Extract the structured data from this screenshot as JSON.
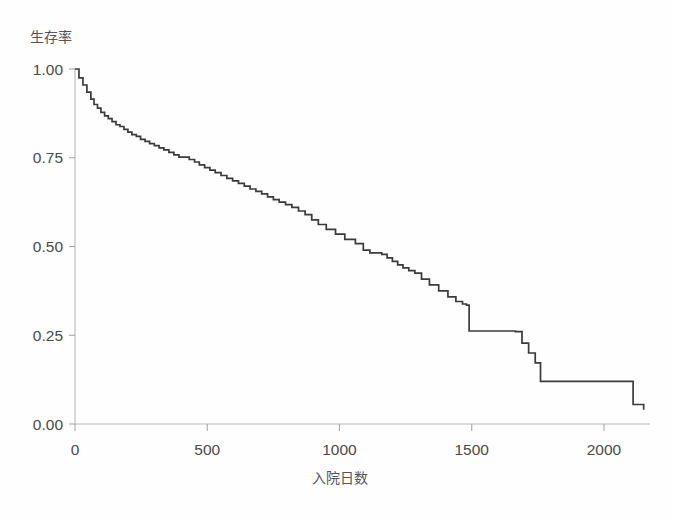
{
  "chart_data": {
    "type": "line",
    "title": "",
    "subtitle": "",
    "xlabel": "入院日数",
    "ylabel": "生存率",
    "xlim": [
      0,
      2180
    ],
    "ylim": [
      0,
      1.0
    ],
    "grid": false,
    "legend": null,
    "x_ticks": [
      {
        "value": 0,
        "label": "0"
      },
      {
        "value": 500,
        "label": "500"
      },
      {
        "value": 1000,
        "label": "1000"
      },
      {
        "value": 1500,
        "label": "1500"
      },
      {
        "value": 2000,
        "label": "2000"
      }
    ],
    "y_ticks": [
      {
        "value": 0.0,
        "label": "0.00"
      },
      {
        "value": 0.25,
        "label": "0.25"
      },
      {
        "value": 0.5,
        "label": "0.50"
      },
      {
        "value": 0.75,
        "label": "0.75"
      },
      {
        "value": 1.0,
        "label": "1.00"
      }
    ],
    "series": [
      {
        "name": "survival",
        "step": "post",
        "color": "#3b3b3b",
        "x": [
          0,
          15,
          30,
          45,
          60,
          72,
          85,
          98,
          112,
          126,
          140,
          155,
          170,
          185,
          200,
          215,
          232,
          248,
          265,
          282,
          300,
          318,
          336,
          355,
          374,
          393,
          412,
          432,
          452,
          470,
          490,
          510,
          530,
          552,
          574,
          596,
          618,
          640,
          662,
          684,
          706,
          728,
          750,
          772,
          796,
          820,
          845,
          870,
          895,
          920,
          950,
          985,
          1020,
          1060,
          1090,
          1115,
          1140,
          1160,
          1180,
          1200,
          1220,
          1240,
          1262,
          1285,
          1310,
          1340,
          1375,
          1410,
          1440,
          1465,
          1480,
          1490,
          1665,
          1690,
          1715,
          1740,
          1760,
          2085,
          2110,
          2150
        ],
        "y": [
          1.0,
          0.975,
          0.955,
          0.935,
          0.915,
          0.9,
          0.89,
          0.878,
          0.868,
          0.86,
          0.852,
          0.843,
          0.838,
          0.83,
          0.822,
          0.815,
          0.81,
          0.802,
          0.796,
          0.79,
          0.784,
          0.778,
          0.772,
          0.765,
          0.758,
          0.752,
          0.752,
          0.745,
          0.738,
          0.73,
          0.722,
          0.715,
          0.708,
          0.7,
          0.692,
          0.685,
          0.678,
          0.67,
          0.662,
          0.655,
          0.648,
          0.64,
          0.632,
          0.625,
          0.618,
          0.61,
          0.6,
          0.59,
          0.575,
          0.562,
          0.548,
          0.535,
          0.52,
          0.508,
          0.49,
          0.482,
          0.482,
          0.478,
          0.468,
          0.458,
          0.448,
          0.44,
          0.432,
          0.425,
          0.408,
          0.392,
          0.375,
          0.358,
          0.345,
          0.338,
          0.335,
          0.262,
          0.26,
          0.228,
          0.2,
          0.172,
          0.12,
          0.12,
          0.055,
          0.04
        ]
      }
    ]
  },
  "axes": {
    "y_title": "生存率",
    "x_title": "入院日数"
  }
}
